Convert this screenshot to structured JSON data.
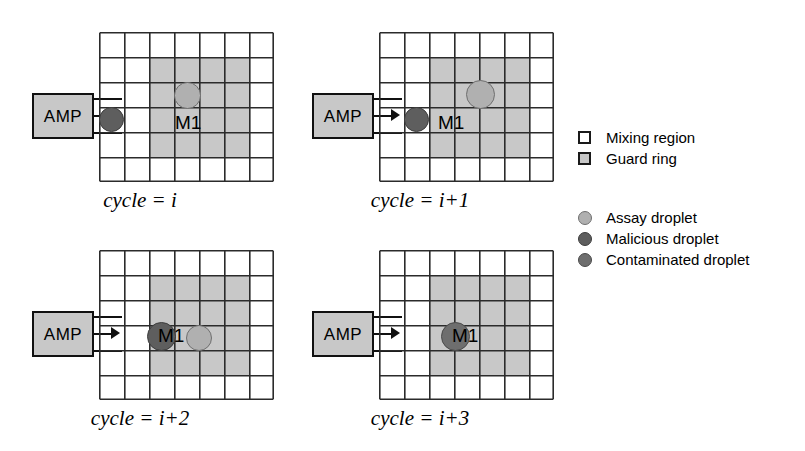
{
  "figure": {
    "grid": {
      "columns": 7,
      "rows": 6,
      "cell_size_px": 25,
      "line_color": "#2b2b2b",
      "mixing_region_color": "#ffffff",
      "guard_ring_color": "#c8c8c8"
    },
    "colors": {
      "amp_fill": "#c8c8c8",
      "outline": "#111111",
      "assay_droplet": "#b0b0b0",
      "malicious_droplet": "#5e5e5e",
      "contaminated_droplet": "#6e6e6e"
    },
    "panels": [
      {
        "id": "p1",
        "caption": "cycle = i",
        "amp_label": "AMP",
        "module_label": "M1",
        "module_label_pos": {
          "x": 175,
          "y": 103
        },
        "guard_ring": {
          "col": 3,
          "row": 2,
          "cols": 4,
          "rows": 4
        },
        "droplets": [
          {
            "kind": "malicious",
            "name": "malicious-droplet",
            "x": 99,
            "y": 97,
            "d": 25
          },
          {
            "kind": "assay",
            "name": "assay-droplet",
            "x": 174,
            "y": 72,
            "d": 27
          }
        ]
      },
      {
        "id": "p2",
        "caption": "cycle = i+1",
        "amp_label": "AMP",
        "module_label": "M1",
        "module_label_pos": {
          "x": 158,
          "y": 103
        },
        "guard_ring": {
          "col": 3,
          "row": 2,
          "cols": 4,
          "rows": 4
        },
        "droplets": [
          {
            "kind": "malicious",
            "name": "malicious-droplet",
            "x": 124,
            "y": 97,
            "d": 25
          },
          {
            "kind": "assay",
            "name": "assay-droplet",
            "x": 186,
            "y": 70,
            "d": 29
          }
        ]
      },
      {
        "id": "p3",
        "caption": "cycle = i+2",
        "amp_label": "AMP",
        "module_label": "M1",
        "module_label_pos": {
          "x": 158,
          "y": 98
        },
        "guard_ring": {
          "col": 3,
          "row": 2,
          "cols": 4,
          "rows": 4
        },
        "droplets": [
          {
            "kind": "malicious",
            "name": "malicious-droplet",
            "x": 147,
            "y": 94,
            "d": 29
          },
          {
            "kind": "assay",
            "name": "assay-droplet",
            "x": 186,
            "y": 97,
            "d": 26
          }
        ]
      },
      {
        "id": "p4",
        "caption": "cycle = i+3",
        "amp_label": "AMP",
        "module_label": "M1",
        "module_label_pos": {
          "x": 172,
          "y": 98
        },
        "guard_ring": {
          "col": 3,
          "row": 2,
          "cols": 4,
          "rows": 4
        },
        "droplets": [
          {
            "kind": "contaminated",
            "name": "contaminated-droplet",
            "x": 161,
            "y": 94,
            "d": 29
          }
        ]
      }
    ]
  },
  "legend": {
    "regions": [
      {
        "swatch": "square",
        "style": "sw-mixing",
        "icon_name": "mixing-region-swatch",
        "label": "Mixing region"
      },
      {
        "swatch": "square",
        "style": "sw-guard",
        "icon_name": "guard-ring-swatch",
        "label": "Guard ring"
      }
    ],
    "droplets": [
      {
        "swatch": "circle",
        "style": "sw-assay",
        "icon_name": "assay-droplet-swatch",
        "label": "Assay droplet"
      },
      {
        "swatch": "circle",
        "style": "sw-malicious",
        "icon_name": "malicious-droplet-swatch",
        "label": "Malicious droplet"
      },
      {
        "swatch": "circle",
        "style": "sw-contaminated",
        "icon_name": "contaminated-droplet-swatch",
        "label": "Contaminated droplet"
      }
    ]
  }
}
